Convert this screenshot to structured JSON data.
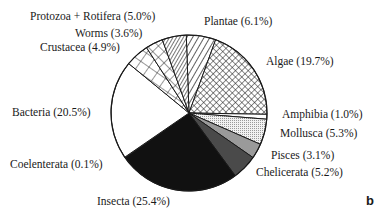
{
  "chart_data": {
    "type": "pie",
    "title": "",
    "panel_label": "b",
    "start_angle_deg": -2,
    "direction": "clockwise",
    "center": [
      189,
      113
    ],
    "radius": 78,
    "slices": [
      {
        "name": "Plantae",
        "value": 6.1,
        "label": "Plantae (6.1%)",
        "pattern": "hatch-sparse",
        "lx": 204,
        "ly": 16
      },
      {
        "name": "Algae",
        "value": 19.7,
        "label": "Algae (19.7%)",
        "pattern": "crosshatch-fine",
        "lx": 266,
        "ly": 56
      },
      {
        "name": "Amphibia",
        "value": 1.0,
        "label": "Amphibia (1.0%)",
        "pattern": "white",
        "lx": 282,
        "ly": 109
      },
      {
        "name": "Mollusca",
        "value": 5.3,
        "label": "Mollusca (5.3%)",
        "pattern": "dots",
        "lx": 280,
        "ly": 128
      },
      {
        "name": "Pisces",
        "value": 3.1,
        "label": "Pisces (3.1%)",
        "pattern": "gray-light",
        "lx": 271,
        "ly": 150
      },
      {
        "name": "Chelicerata",
        "value": 5.2,
        "label": "Chelicerata (5.2%)",
        "pattern": "gray-dark",
        "lx": 256,
        "ly": 167
      },
      {
        "name": "Insecta",
        "value": 25.4,
        "label": "Insecta (25.4%)",
        "pattern": "black",
        "lx": 97,
        "ly": 196
      },
      {
        "name": "Coelenterata",
        "value": 0.1,
        "label": "Coelenterata (0.1%)",
        "pattern": "white",
        "lx": 10,
        "ly": 159
      },
      {
        "name": "Bacteria",
        "value": 20.5,
        "label": "Bacteria (20.5%)",
        "pattern": "white",
        "lx": 12,
        "ly": 107
      },
      {
        "name": "Crustacea",
        "value": 4.9,
        "label": "Crustacea (4.9%)",
        "pattern": "grid",
        "lx": 40,
        "ly": 42
      },
      {
        "name": "Worms",
        "value": 3.6,
        "label": "Worms (3.6%)",
        "pattern": "crosshatch-wide",
        "lx": 75,
        "ly": 28
      },
      {
        "name": "Protozoa + Rotifera",
        "value": 5.0,
        "label": "Protozoa + Rotifera (5.0%)",
        "pattern": "hatch-dense",
        "lx": 30,
        "ly": 11
      }
    ],
    "colors": {
      "outline": "#1a1a1a",
      "black": "#111111",
      "gray-dark": "#4a4a4a",
      "gray-light": "#9a9a9a",
      "dots": "#e6e6e6",
      "white": "#ffffff"
    }
  }
}
